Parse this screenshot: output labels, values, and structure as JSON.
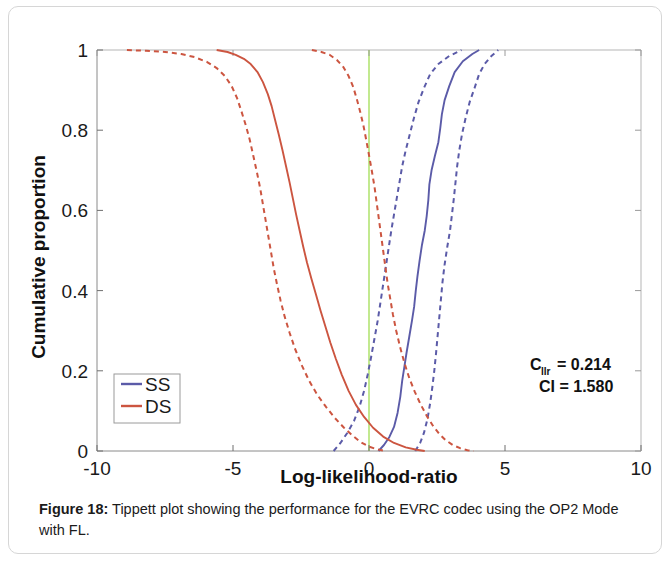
{
  "figure": {
    "caption_label": "Figure 18:",
    "caption_text": " Tippett plot showing the performance for the EVRC codec using the OP2 Mode with FL."
  },
  "annotations": {
    "cllr_main": "C",
    "cllr_sub": "llr",
    "cllr_value": " = 0.214",
    "ci_line": "CI = 1.580"
  },
  "legend": {
    "items": [
      {
        "label": "SS",
        "color": "#5b5ba8"
      },
      {
        "label": "DS",
        "color": "#cc5540"
      }
    ]
  },
  "chart_data": {
    "type": "line",
    "title": "",
    "xlabel": "Log-likelihood-ratio",
    "ylabel": "Cumulative proportion",
    "xlim": [
      -10,
      10
    ],
    "ylim": [
      0,
      1
    ],
    "xticks": [
      -10,
      -5,
      0,
      5,
      10
    ],
    "xticklabels": [
      "-10",
      "-5",
      "0",
      "5",
      "10"
    ],
    "yticks": [
      0,
      0.2,
      0.4,
      0.6,
      0.8,
      1
    ],
    "yticklabels": [
      "0",
      "0.2",
      "0.4",
      "0.6",
      "0.8",
      "1"
    ],
    "grid": false,
    "legend_position": "lower-left",
    "reference_line": {
      "x": 0,
      "color": "#a8e060",
      "orientation": "vertical"
    },
    "colors": {
      "SS": "#5b5ba8",
      "DS": "#cc5540"
    },
    "series": [
      {
        "name": "SS",
        "role": "center",
        "style": "solid",
        "color": "#5b5ba8",
        "points": [
          [
            0.35,
            0.0
          ],
          [
            0.55,
            0.015
          ],
          [
            0.75,
            0.035
          ],
          [
            0.92,
            0.06
          ],
          [
            1.05,
            0.095
          ],
          [
            1.15,
            0.135
          ],
          [
            1.22,
            0.175
          ],
          [
            1.3,
            0.21
          ],
          [
            1.38,
            0.245
          ],
          [
            1.48,
            0.285
          ],
          [
            1.58,
            0.325
          ],
          [
            1.66,
            0.36
          ],
          [
            1.72,
            0.4
          ],
          [
            1.78,
            0.435
          ],
          [
            1.86,
            0.475
          ],
          [
            1.95,
            0.515
          ],
          [
            2.05,
            0.55
          ],
          [
            2.12,
            0.585
          ],
          [
            2.18,
            0.625
          ],
          [
            2.22,
            0.665
          ],
          [
            2.3,
            0.7
          ],
          [
            2.42,
            0.735
          ],
          [
            2.55,
            0.77
          ],
          [
            2.62,
            0.805
          ],
          [
            2.68,
            0.84
          ],
          [
            2.78,
            0.875
          ],
          [
            2.95,
            0.91
          ],
          [
            3.15,
            0.945
          ],
          [
            3.45,
            0.972
          ],
          [
            3.8,
            0.99
          ],
          [
            4.05,
            1.0
          ]
        ]
      },
      {
        "name": "SS",
        "role": "lower-ci",
        "style": "dashed",
        "color": "#5b5ba8",
        "points": [
          [
            -1.3,
            0.0
          ],
          [
            -1.05,
            0.02
          ],
          [
            -0.8,
            0.045
          ],
          [
            -0.55,
            0.075
          ],
          [
            -0.35,
            0.11
          ],
          [
            -0.18,
            0.15
          ],
          [
            -0.05,
            0.19
          ],
          [
            0.08,
            0.235
          ],
          [
            0.2,
            0.28
          ],
          [
            0.32,
            0.325
          ],
          [
            0.42,
            0.37
          ],
          [
            0.52,
            0.415
          ],
          [
            0.62,
            0.46
          ],
          [
            0.72,
            0.505
          ],
          [
            0.82,
            0.55
          ],
          [
            0.92,
            0.59
          ],
          [
            1.02,
            0.63
          ],
          [
            1.12,
            0.67
          ],
          [
            1.22,
            0.71
          ],
          [
            1.35,
            0.75
          ],
          [
            1.5,
            0.79
          ],
          [
            1.65,
            0.83
          ],
          [
            1.82,
            0.87
          ],
          [
            2.02,
            0.905
          ],
          [
            2.25,
            0.94
          ],
          [
            2.55,
            0.965
          ],
          [
            2.95,
            0.985
          ],
          [
            3.4,
            1.0
          ]
        ]
      },
      {
        "name": "SS",
        "role": "upper-ci",
        "style": "dashed",
        "color": "#5b5ba8",
        "points": [
          [
            1.7,
            0.0
          ],
          [
            1.88,
            0.02
          ],
          [
            2.02,
            0.045
          ],
          [
            2.15,
            0.08
          ],
          [
            2.25,
            0.12
          ],
          [
            2.33,
            0.16
          ],
          [
            2.4,
            0.2
          ],
          [
            2.46,
            0.24
          ],
          [
            2.52,
            0.285
          ],
          [
            2.58,
            0.33
          ],
          [
            2.64,
            0.375
          ],
          [
            2.7,
            0.42
          ],
          [
            2.78,
            0.465
          ],
          [
            2.88,
            0.51
          ],
          [
            2.98,
            0.55
          ],
          [
            3.05,
            0.59
          ],
          [
            3.12,
            0.63
          ],
          [
            3.18,
            0.67
          ],
          [
            3.24,
            0.71
          ],
          [
            3.32,
            0.75
          ],
          [
            3.42,
            0.79
          ],
          [
            3.55,
            0.83
          ],
          [
            3.7,
            0.87
          ],
          [
            3.88,
            0.905
          ],
          [
            4.05,
            0.94
          ],
          [
            4.25,
            0.965
          ],
          [
            4.5,
            0.985
          ],
          [
            4.75,
            1.0
          ]
        ]
      },
      {
        "name": "DS",
        "role": "center",
        "style": "solid",
        "color": "#cc5540",
        "points": [
          [
            -5.6,
            1.0
          ],
          [
            -5.2,
            0.995
          ],
          [
            -4.9,
            0.988
          ],
          [
            -4.6,
            0.978
          ],
          [
            -4.35,
            0.965
          ],
          [
            -4.1,
            0.945
          ],
          [
            -3.9,
            0.92
          ],
          [
            -3.72,
            0.89
          ],
          [
            -3.58,
            0.86
          ],
          [
            -3.45,
            0.825
          ],
          [
            -3.32,
            0.79
          ],
          [
            -3.18,
            0.75
          ],
          [
            -3.05,
            0.71
          ],
          [
            -2.92,
            0.67
          ],
          [
            -2.8,
            0.63
          ],
          [
            -2.68,
            0.59
          ],
          [
            -2.55,
            0.55
          ],
          [
            -2.42,
            0.51
          ],
          [
            -2.28,
            0.47
          ],
          [
            -2.12,
            0.43
          ],
          [
            -1.95,
            0.39
          ],
          [
            -1.78,
            0.35
          ],
          [
            -1.6,
            0.31
          ],
          [
            -1.42,
            0.27
          ],
          [
            -1.22,
            0.23
          ],
          [
            -1.0,
            0.19
          ],
          [
            -0.75,
            0.15
          ],
          [
            -0.48,
            0.115
          ],
          [
            -0.18,
            0.085
          ],
          [
            0.15,
            0.058
          ],
          [
            0.52,
            0.036
          ],
          [
            0.92,
            0.02
          ],
          [
            1.35,
            0.009
          ],
          [
            1.75,
            0.003
          ],
          [
            2.05,
            0.0
          ]
        ]
      },
      {
        "name": "DS",
        "role": "lower-ci",
        "style": "dashed",
        "color": "#cc5540",
        "points": [
          [
            -8.9,
            1.0
          ],
          [
            -8.2,
            0.998
          ],
          [
            -7.5,
            0.995
          ],
          [
            -6.9,
            0.99
          ],
          [
            -6.4,
            0.982
          ],
          [
            -5.95,
            0.97
          ],
          [
            -5.6,
            0.955
          ],
          [
            -5.3,
            0.935
          ],
          [
            -5.05,
            0.91
          ],
          [
            -4.85,
            0.88
          ],
          [
            -4.68,
            0.845
          ],
          [
            -4.52,
            0.81
          ],
          [
            -4.38,
            0.775
          ],
          [
            -4.25,
            0.735
          ],
          [
            -4.12,
            0.695
          ],
          [
            -4.0,
            0.655
          ],
          [
            -3.9,
            0.615
          ],
          [
            -3.8,
            0.575
          ],
          [
            -3.7,
            0.535
          ],
          [
            -3.6,
            0.495
          ],
          [
            -3.5,
            0.455
          ],
          [
            -3.38,
            0.415
          ],
          [
            -3.25,
            0.375
          ],
          [
            -3.1,
            0.335
          ],
          [
            -2.92,
            0.295
          ],
          [
            -2.72,
            0.255
          ],
          [
            -2.48,
            0.215
          ],
          [
            -2.2,
            0.175
          ],
          [
            -1.9,
            0.14
          ],
          [
            -1.58,
            0.11
          ],
          [
            -1.25,
            0.082
          ],
          [
            -0.92,
            0.058
          ],
          [
            -0.6,
            0.038
          ],
          [
            -0.3,
            0.022
          ],
          [
            0.0,
            0.011
          ],
          [
            0.3,
            0.004
          ],
          [
            0.6,
            0.0
          ]
        ]
      },
      {
        "name": "DS",
        "role": "upper-ci",
        "style": "dashed",
        "color": "#cc5540",
        "points": [
          [
            -2.1,
            1.0
          ],
          [
            -1.75,
            0.995
          ],
          [
            -1.45,
            0.988
          ],
          [
            -1.18,
            0.975
          ],
          [
            -0.95,
            0.958
          ],
          [
            -0.75,
            0.935
          ],
          [
            -0.58,
            0.908
          ],
          [
            -0.45,
            0.878
          ],
          [
            -0.32,
            0.845
          ],
          [
            -0.2,
            0.81
          ],
          [
            -0.1,
            0.775
          ],
          [
            0.0,
            0.738
          ],
          [
            0.1,
            0.7
          ],
          [
            0.2,
            0.66
          ],
          [
            0.28,
            0.62
          ],
          [
            0.36,
            0.58
          ],
          [
            0.44,
            0.54
          ],
          [
            0.52,
            0.5
          ],
          [
            0.6,
            0.46
          ],
          [
            0.68,
            0.42
          ],
          [
            0.78,
            0.38
          ],
          [
            0.88,
            0.34
          ],
          [
            1.0,
            0.3
          ],
          [
            1.14,
            0.26
          ],
          [
            1.3,
            0.22
          ],
          [
            1.48,
            0.182
          ],
          [
            1.68,
            0.148
          ],
          [
            1.9,
            0.116
          ],
          [
            2.12,
            0.088
          ],
          [
            2.35,
            0.063
          ],
          [
            2.58,
            0.043
          ],
          [
            2.82,
            0.027
          ],
          [
            3.08,
            0.015
          ],
          [
            3.35,
            0.007
          ],
          [
            3.62,
            0.002
          ],
          [
            3.85,
            0.0
          ]
        ]
      }
    ]
  }
}
